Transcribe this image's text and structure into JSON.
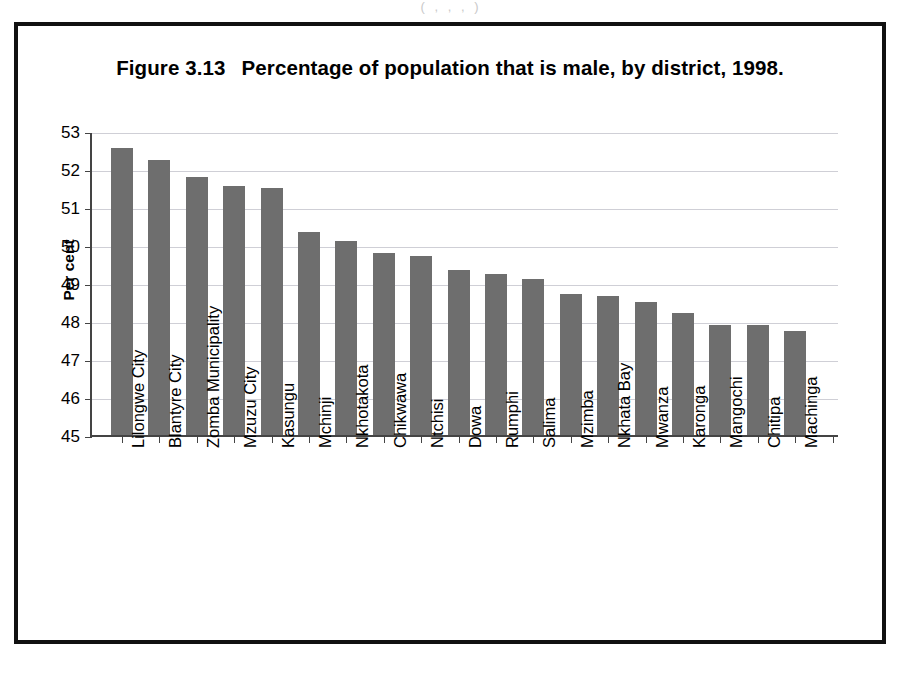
{
  "scan": {
    "top_remnant": "(               ,                ,               ,            )"
  },
  "figure": {
    "number_label": "Figure 3.13",
    "title": "Percentage of population that is male, by district, 1998."
  },
  "axes": {
    "y_title": "Per cent"
  },
  "colors": {
    "bar_fill": "#6e6e6e",
    "frame": "#111111",
    "gridline": "#cfcfd6",
    "axis": "#444444",
    "text": "#000000"
  },
  "chart_data": {
    "type": "bar",
    "xlabel": "",
    "ylabel": "Per cent",
    "ylim": [
      45,
      53
    ],
    "yticks": [
      45,
      46,
      47,
      48,
      49,
      50,
      51,
      52,
      53
    ],
    "grid": true,
    "legend": false,
    "orientation": "vertical",
    "bar_color": "#6e6e6e",
    "categories": [
      "Lilongwe City",
      "Blantyre City",
      "Zomba Municipality",
      "Mzuzu City",
      "Kasungu",
      "Mchinji",
      "Nkhotakota",
      "Chikwawa",
      "Ntchisi",
      "Dowa",
      "Rumphi",
      "Salima",
      "Mzimba",
      "Nkhata Bay",
      "Mwanza",
      "Karonga",
      "Mangochi",
      "Chitipa",
      "Machinga"
    ],
    "values": [
      52.55,
      52.25,
      51.8,
      51.55,
      51.5,
      50.35,
      50.1,
      49.8,
      49.7,
      49.35,
      49.25,
      49.1,
      48.7,
      48.65,
      48.5,
      48.2,
      47.9,
      47.9,
      47.75
    ]
  }
}
